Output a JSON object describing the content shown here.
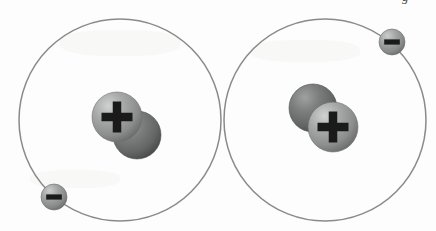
{
  "figure": {
    "width": 436,
    "height": 231,
    "background_color": "#fdfdfd"
  },
  "style": {
    "orbit_stroke_color": "#8a8a8a",
    "orbit_stroke_width": 1.5,
    "orbit_fill": "none",
    "proton_color": "#9a9d9b",
    "proton_highlight_color": "#c9ccca",
    "proton_shadow_color": "#6d706e",
    "neutron_color": "#6e7270",
    "neutron_highlight_color": "#9b9e9c",
    "neutron_shadow_color": "#4c4f4e",
    "electron_color": "#9a9d9b",
    "electron_highlight_color": "#c6c9c7",
    "electron_shadow_color": "#6b6e6c",
    "charge_glyph_color": "#1a1a1a"
  },
  "atoms": [
    {
      "id": "atom-left",
      "label": "Left atom",
      "orbit": {
        "cx": 120,
        "cy": 120,
        "r": 101
      },
      "nucleus": {
        "particles": [
          {
            "kind": "neutron",
            "label": "neutron",
            "charge_symbol": "",
            "cx": 137,
            "cy": 135,
            "r": 24,
            "z": 1
          },
          {
            "kind": "proton",
            "label": "proton",
            "charge_symbol": "+",
            "cx": 117,
            "cy": 117,
            "r": 25,
            "z": 2
          }
        ]
      },
      "electron": {
        "label": "electron",
        "charge_symbol": "−",
        "cx": 54,
        "cy": 197,
        "r": 13
      }
    },
    {
      "id": "atom-right",
      "label": "Right atom",
      "orbit": {
        "cx": 325,
        "cy": 120,
        "r": 101
      },
      "nucleus": {
        "particles": [
          {
            "kind": "neutron",
            "label": "neutron",
            "charge_symbol": "",
            "cx": 313,
            "cy": 108,
            "r": 24,
            "z": 1
          },
          {
            "kind": "proton",
            "label": "proton",
            "charge_symbol": "+",
            "cx": 333,
            "cy": 127,
            "r": 25,
            "z": 2
          }
        ]
      },
      "electron": {
        "label": "electron",
        "charge_symbol": "−",
        "cx": 392,
        "cy": 42,
        "r": 13
      }
    }
  ],
  "artifacts": {
    "caption_remnant": {
      "text": "g",
      "x": 402,
      "visible": true
    }
  }
}
